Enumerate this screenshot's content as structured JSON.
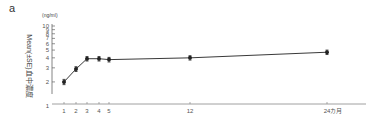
{
  "panel_label": "a",
  "chart_data": {
    "type": "line",
    "title": "",
    "xlabel": "",
    "ylabel": "Mean(±SE)血中濃度",
    "yunit": "(ng/ml)",
    "yscale": "log",
    "ylim": [
      1,
      10
    ],
    "yticks": [
      1,
      2,
      3,
      4,
      5,
      6,
      7,
      8,
      9,
      10
    ],
    "ytick_labels": [
      "1",
      "2",
      "3",
      "4",
      "5",
      "6",
      "7",
      "8",
      "9",
      "10"
    ],
    "xticks": [
      1,
      2,
      3,
      4,
      5,
      12,
      24
    ],
    "xtick_labels": [
      "1",
      "2",
      "3",
      "4",
      "5",
      "12",
      "24カ月"
    ],
    "grid": false,
    "legend": null,
    "series": [
      {
        "name": "Mean blood concentration",
        "x": [
          1,
          2,
          3,
          4,
          5,
          12,
          24
        ],
        "values": [
          2.0,
          2.9,
          3.9,
          3.9,
          3.8,
          4.0,
          4.7
        ],
        "errors": [
          0.15,
          0.2,
          0.25,
          0.25,
          0.25,
          0.25,
          0.3
        ],
        "marker": "filled-circle",
        "color": "#222222"
      }
    ]
  }
}
